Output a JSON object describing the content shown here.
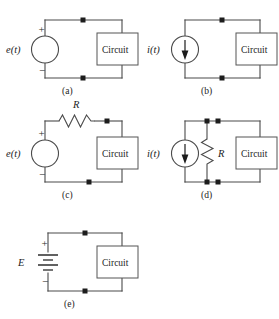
{
  "figure": {
    "background_color": "#ffffff",
    "wire_color": "#4a4a4a",
    "node_color": "#1c1c1c",
    "text_color": "#1c1c1c",
    "box_label": "Circuit"
  },
  "panels": [
    {
      "id": "a",
      "caption": "(a)",
      "source_label": "e(t)",
      "source_type": "voltage-source-circle",
      "plus_sign": "+",
      "minus_sign": "−",
      "box_label": "Circuit",
      "has_resistor": false,
      "resistor_label": "",
      "node_count": 2
    },
    {
      "id": "b",
      "caption": "(b)",
      "source_label": "i(t)",
      "source_type": "current-source-circle",
      "plus_sign": "",
      "minus_sign": "",
      "box_label": "Circuit",
      "has_resistor": false,
      "resistor_label": "",
      "node_count": 2
    },
    {
      "id": "c",
      "caption": "(c)",
      "source_label": "e(t)",
      "source_type": "voltage-source-circle",
      "plus_sign": "+",
      "minus_sign": "−",
      "box_label": "Circuit",
      "has_resistor": true,
      "resistor_label": "R",
      "resistor_orientation": "series-horizontal",
      "node_count": 2
    },
    {
      "id": "d",
      "caption": "(d)",
      "source_label": "i(t)",
      "source_type": "current-source-circle",
      "plus_sign": "",
      "minus_sign": "",
      "box_label": "Circuit",
      "has_resistor": true,
      "resistor_label": "R",
      "resistor_orientation": "parallel-vertical",
      "node_count": 4
    },
    {
      "id": "e",
      "caption": "(e)",
      "source_label": "E",
      "source_type": "battery",
      "plus_sign": "+",
      "minus_sign": "−",
      "box_label": "Circuit",
      "has_resistor": false,
      "resistor_label": "",
      "node_count": 2
    }
  ]
}
